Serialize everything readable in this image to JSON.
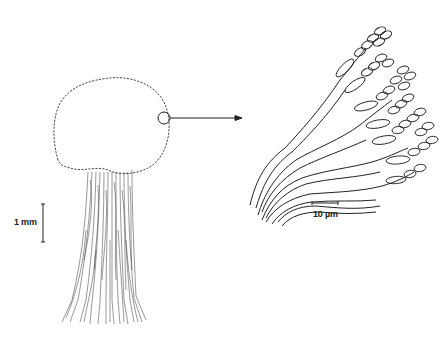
{
  "figure": {
    "scale_bar_large": {
      "label": "1 mm"
    },
    "scale_bar_small": {
      "label": "10 µm"
    },
    "colors": {
      "ink": "#222222",
      "background": "#ffffff"
    }
  }
}
